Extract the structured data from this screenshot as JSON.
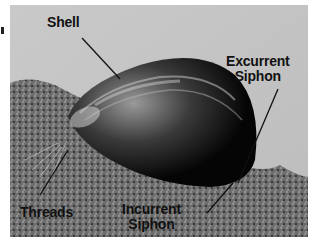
{
  "figure": {
    "colors": {
      "background": "#c8c8c8",
      "shell_dark": "#0a0a0a",
      "shell_highlight": "#d8d8d8",
      "rock": "#7a7a7a",
      "label_text": "#111111"
    },
    "labels": [
      {
        "id": "shell",
        "lines": [
          "Shell"
        ]
      },
      {
        "id": "excurrent_siphon",
        "lines": [
          "Excurrent",
          "Siphon"
        ]
      },
      {
        "id": "threads",
        "lines": [
          "Threads"
        ]
      },
      {
        "id": "incurrent_siphon",
        "lines": [
          "Incurrent",
          "Siphon"
        ]
      }
    ]
  }
}
